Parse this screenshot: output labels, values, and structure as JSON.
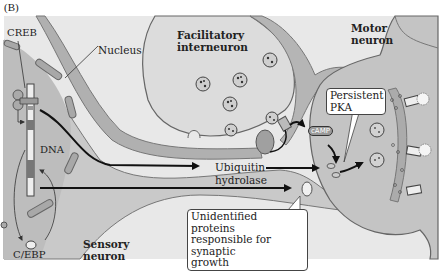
{
  "figure": {
    "panel_label": "(B)",
    "labels": {
      "creb": "CREB",
      "nucleus": "Nucleus",
      "dna": "DNA",
      "cebp": "C/EBP",
      "facilitatory_interneuron_line1": "Facilitatory",
      "facilitatory_interneuron_line2": "interneuron",
      "motor_neuron_line1": "Motor",
      "motor_neuron_line2": "neuron",
      "sensory_neuron_line1": "Sensory",
      "sensory_neuron_line2": "neuron",
      "ubiquitin_line1": "Ubiquitin",
      "ubiquitin_line2": "hydrolase",
      "camp": "cAMP"
    },
    "callouts": {
      "persistent_pka_line1": "Persistent",
      "persistent_pka_line2": "PKA",
      "unidentified_line1": "Unidentified proteins",
      "unidentified_line2": "responsible for synaptic",
      "unidentified_line3": "growth"
    },
    "colors": {
      "background": "#ffffff",
      "frame": "#e6e6e6",
      "cytoplasm": "#cfcfcf",
      "nucleus": "#bdbdbd",
      "membrane": "#9c9c9c",
      "interneuron": "#dcdcdc",
      "arrow": "#111111"
    }
  }
}
